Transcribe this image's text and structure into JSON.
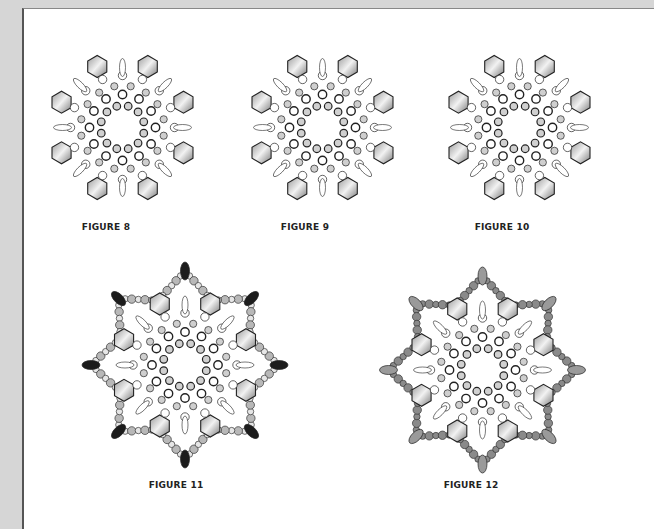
{
  "figures": [
    {
      "id": "fig8",
      "caption": "FIGURE 8"
    },
    {
      "id": "fig9",
      "caption": "FIGURE 9"
    },
    {
      "id": "fig10",
      "caption": "FIGURE 10"
    },
    {
      "id": "fig11",
      "caption": "FIGURE 11"
    },
    {
      "id": "fig12",
      "caption": "FIGURE 12"
    }
  ],
  "colors": {
    "page_background": "#d6d6d6",
    "sheet": "#ffffff",
    "outline": "#222222",
    "bead_gray": "#bdbdbd",
    "bead_dark": "#1a1a1a",
    "hex_fill": "#c8c8c8"
  }
}
